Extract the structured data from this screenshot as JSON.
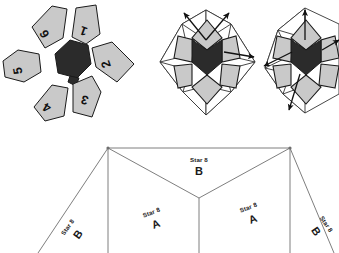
{
  "page": {
    "background_color": "#ffffff"
  },
  "colors": {
    "piece_light": "#c9c9c9",
    "piece_light_alt": "#d2d2d2",
    "piece_dark": "#2b2b2b",
    "outline": "#1a1a1a",
    "net_outline": "#6f6f6f",
    "text": "#111111"
  },
  "figures": {
    "exploded": {
      "name": "exploded-star-pieces",
      "center_piece_label": "",
      "pieces": [
        {
          "number": "1"
        },
        {
          "number": "2"
        },
        {
          "number": "3"
        },
        {
          "number": "4"
        },
        {
          "number": "5"
        },
        {
          "number": "6"
        }
      ]
    },
    "assembled": {
      "name": "assembled-star-with-arrows",
      "arrow_count": 6
    },
    "assembled_clipped": {
      "name": "assembled-star-clipped",
      "arrow_count": 4
    }
  },
  "net": {
    "name": "star-8-fold-net",
    "panels": [
      {
        "id": "panel-b-left",
        "title": "Star 8",
        "letter": "B"
      },
      {
        "id": "panel-a-left",
        "title": "Star 8",
        "letter": "A"
      },
      {
        "id": "panel-b-top",
        "title": "Star 8",
        "letter": "B"
      },
      {
        "id": "panel-a-right",
        "title": "Star 8",
        "letter": "A"
      },
      {
        "id": "panel-b-right",
        "title": "Star 8",
        "letter": "B"
      }
    ]
  }
}
